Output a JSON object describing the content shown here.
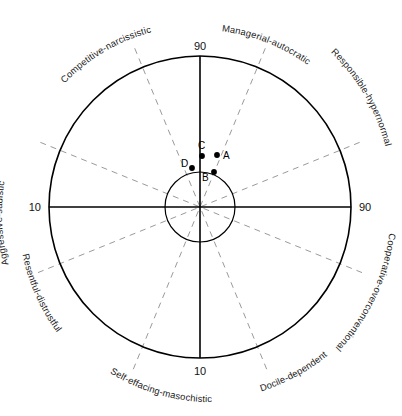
{
  "figure": {
    "footer_note": ""
  },
  "chart_data": {
    "type": "scatter",
    "subtitle": "",
    "xlabel": "",
    "ylabel": "",
    "coordinate_system": "polar",
    "grid": false,
    "legend_position": "none",
    "axis_ticks": {
      "top": "90",
      "right": "90",
      "bottom": "10",
      "left": "10"
    },
    "rings": [
      {
        "name": "outer-circle",
        "value": 90,
        "radius_px": 151
      },
      {
        "name": "inner-circle",
        "value": 50,
        "radius_px": 35
      }
    ],
    "sectors": [
      {
        "id": "managerial-autocratic",
        "label": "Managerial-autocratic",
        "angle_deg": 67.5
      },
      {
        "id": "responsible-hypernormal",
        "label": "Responsible-hypernormal",
        "angle_deg": 22.5
      },
      {
        "id": "cooperative-overconventional",
        "label": "Cooperative-overconventional",
        "angle_deg": -22.5
      },
      {
        "id": "docile-dependent",
        "label": "Docile-dependent",
        "angle_deg": -67.5
      },
      {
        "id": "self-effacing-masochistic",
        "label": "Self-effacing-masochistic",
        "angle_deg": -112.5
      },
      {
        "id": "resentful-distrustful",
        "label": "Resentful-distrustful",
        "angle_deg": -157.5
      },
      {
        "id": "aggressive-sadistic",
        "label": "Aggressive-sadistic",
        "angle_deg": 157.5
      },
      {
        "id": "competitive-narcissistic",
        "label": "Competitive-narcissistic",
        "angle_deg": 112.5
      }
    ],
    "points": [
      {
        "label": "A",
        "x_px": 217,
        "y_px": 155,
        "label_dx": 6,
        "label_dy": 3.5
      },
      {
        "label": "B",
        "x_px": 214,
        "y_px": 172,
        "label_dx": -12,
        "label_dy": 9
      },
      {
        "label": "C",
        "x_px": 202,
        "y_px": 156,
        "label_dx": -4,
        "label_dy": -7
      },
      {
        "label": "D",
        "x_px": 192,
        "y_px": 168,
        "label_dx": -11,
        "label_dy": -1
      }
    ]
  },
  "labels": {
    "tick_top": "90",
    "tick_right": "90",
    "tick_bottom": "10",
    "tick_left": "10",
    "sector_managerial": "Managerial-autocratic",
    "sector_competitive": "Competitive-narcissistic",
    "sector_responsible": "Responsible-hypernormal",
    "sector_aggressive": "Aggressive-sadistic",
    "sector_cooperative": "Cooperative-overconventional",
    "sector_resentful": "Resentful-distrustful",
    "sector_docile": "Docile-dependent",
    "sector_selfeffacing": "Self-effacing-masochistic",
    "point_a": "A",
    "point_b": "B",
    "point_c": "C",
    "point_d": "D"
  },
  "colors": {
    "stroke_solid": "#000000",
    "stroke_dashed": "#9a9a9a",
    "text": "#1a1a1a",
    "background": "#ffffff"
  }
}
